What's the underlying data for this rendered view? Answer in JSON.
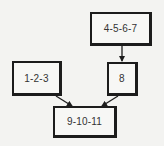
{
  "diagram": {
    "type": "flow",
    "nodes": [
      {
        "id": "n1",
        "label": "1-2-3",
        "x": 12,
        "y": 61,
        "w": 50,
        "h": 35
      },
      {
        "id": "n2",
        "label": "4-5-6-7",
        "x": 90,
        "y": 12,
        "w": 62,
        "h": 34
      },
      {
        "id": "n3",
        "label": "8",
        "x": 107,
        "y": 62,
        "w": 31,
        "h": 34
      },
      {
        "id": "n4",
        "label": "9-10-11",
        "x": 53,
        "y": 106,
        "w": 64,
        "h": 32
      }
    ],
    "edges": [
      {
        "from": "n2",
        "to": "n3"
      },
      {
        "from": "n1",
        "to": "n4"
      },
      {
        "from": "n3",
        "to": "n4"
      }
    ],
    "colors": {
      "background": "#f3f3f1",
      "border": "#1c1c1c",
      "text": "#333333"
    }
  }
}
